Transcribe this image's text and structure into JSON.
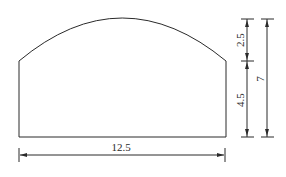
{
  "diagram": {
    "type": "cross-section with arched top",
    "dimensions": {
      "width": "12.5",
      "arch_height": "2.5",
      "wall_height": "4.5",
      "total_height": "7"
    }
  }
}
